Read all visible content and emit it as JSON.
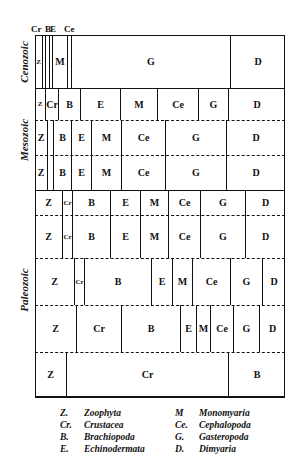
{
  "eras": [
    {
      "label": "Cenozoic",
      "center_y": 62
    },
    {
      "label": "Mesozoic",
      "center_y": 140
    },
    {
      "label": "Paleozoic",
      "center_y": 290
    }
  ],
  "top_labels": [
    {
      "text": "Cr",
      "x": 31
    },
    {
      "text": "B",
      "x": 45
    },
    {
      "text": "E",
      "x": 50
    },
    {
      "text": "Ce",
      "x": 64
    }
  ],
  "rows": [
    {
      "era": "Cenozoic",
      "top": 35,
      "height": 53,
      "bottom_line": "solid",
      "cells": [
        {
          "label": "Z",
          "x": 0,
          "w": 7
        },
        {
          "label": "",
          "x": 7,
          "w": 3
        },
        {
          "label": "",
          "x": 10,
          "w": 4
        },
        {
          "label": "",
          "x": 14,
          "w": 3
        },
        {
          "label": "M",
          "x": 17,
          "w": 15
        },
        {
          "label": "",
          "x": 32,
          "w": 4
        },
        {
          "label": "G",
          "x": 36,
          "w": 159
        },
        {
          "label": "D",
          "x": 195,
          "w": 55
        }
      ]
    },
    {
      "era": "Mesozoic",
      "top": 88,
      "height": 32,
      "bottom_line": "dashed",
      "cells": [
        {
          "label": "Z",
          "x": 0,
          "w": 10
        },
        {
          "label": "Cr",
          "x": 10,
          "w": 13
        },
        {
          "label": "B",
          "x": 23,
          "w": 22
        },
        {
          "label": "E",
          "x": 45,
          "w": 40
        },
        {
          "label": "M",
          "x": 85,
          "w": 37
        },
        {
          "label": "Ce",
          "x": 122,
          "w": 41
        },
        {
          "label": "G",
          "x": 163,
          "w": 30
        },
        {
          "label": "D",
          "x": 193,
          "w": 57
        }
      ]
    },
    {
      "era": "Mesozoic",
      "top": 120,
      "height": 35,
      "bottom_line": "dashed",
      "cells": [
        {
          "label": "Z",
          "x": 0,
          "w": 12
        },
        {
          "label": "",
          "x": 12,
          "w": 6
        },
        {
          "label": "B",
          "x": 18,
          "w": 18
        },
        {
          "label": "E",
          "x": 36,
          "w": 20
        },
        {
          "label": "M",
          "x": 56,
          "w": 30
        },
        {
          "label": "Ce",
          "x": 86,
          "w": 44
        },
        {
          "label": "G",
          "x": 130,
          "w": 61
        },
        {
          "label": "D",
          "x": 191,
          "w": 59
        }
      ]
    },
    {
      "era": "Mesozoic",
      "top": 155,
      "height": 35,
      "bottom_line": "solid",
      "cells": [
        {
          "label": "Z",
          "x": 0,
          "w": 12
        },
        {
          "label": "",
          "x": 12,
          "w": 6
        },
        {
          "label": "B",
          "x": 18,
          "w": 18
        },
        {
          "label": "E",
          "x": 36,
          "w": 20
        },
        {
          "label": "M",
          "x": 56,
          "w": 30
        },
        {
          "label": "Ce",
          "x": 86,
          "w": 44
        },
        {
          "label": "G",
          "x": 130,
          "w": 61
        },
        {
          "label": "D",
          "x": 191,
          "w": 59
        }
      ]
    },
    {
      "era": "Paleozoic",
      "top": 190,
      "height": 25,
      "bottom_line": "dashed",
      "cells": [
        {
          "label": "Z",
          "x": 0,
          "w": 27
        },
        {
          "label": "Cr",
          "x": 27,
          "w": 10
        },
        {
          "label": "B",
          "x": 37,
          "w": 38
        },
        {
          "label": "E",
          "x": 75,
          "w": 30
        },
        {
          "label": "M",
          "x": 105,
          "w": 28
        },
        {
          "label": "Ce",
          "x": 133,
          "w": 32
        },
        {
          "label": "G",
          "x": 165,
          "w": 45
        },
        {
          "label": "D",
          "x": 210,
          "w": 40
        }
      ]
    },
    {
      "era": "Paleozoic",
      "top": 215,
      "height": 43,
      "bottom_line": "dashed",
      "cells": [
        {
          "label": "Z",
          "x": 0,
          "w": 27
        },
        {
          "label": "Cr",
          "x": 27,
          "w": 10
        },
        {
          "label": "B",
          "x": 37,
          "w": 38
        },
        {
          "label": "E",
          "x": 75,
          "w": 30
        },
        {
          "label": "M",
          "x": 105,
          "w": 28
        },
        {
          "label": "Ce",
          "x": 133,
          "w": 32
        },
        {
          "label": "G",
          "x": 165,
          "w": 45
        },
        {
          "label": "D",
          "x": 210,
          "w": 40
        }
      ]
    },
    {
      "era": "Paleozoic",
      "top": 258,
      "height": 47,
      "bottom_line": "dashed",
      "cells": [
        {
          "label": "Z",
          "x": 0,
          "w": 39
        },
        {
          "label": "Cr",
          "x": 39,
          "w": 10
        },
        {
          "label": "B",
          "x": 49,
          "w": 67
        },
        {
          "label": "E",
          "x": 116,
          "w": 21
        },
        {
          "label": "M",
          "x": 137,
          "w": 20
        },
        {
          "label": "Ce",
          "x": 157,
          "w": 38
        },
        {
          "label": "G",
          "x": 195,
          "w": 32
        },
        {
          "label": "D",
          "x": 227,
          "w": 23
        }
      ]
    },
    {
      "era": "Paleozoic",
      "top": 305,
      "height": 47,
      "bottom_line": "dashed",
      "cells": [
        {
          "label": "Z",
          "x": 0,
          "w": 41
        },
        {
          "label": "Cr",
          "x": 41,
          "w": 45
        },
        {
          "label": "B",
          "x": 86,
          "w": 59
        },
        {
          "label": "E",
          "x": 145,
          "w": 16
        },
        {
          "label": "M",
          "x": 161,
          "w": 14
        },
        {
          "label": "Ce",
          "x": 175,
          "w": 23
        },
        {
          "label": "G",
          "x": 198,
          "w": 26
        },
        {
          "label": "D",
          "x": 224,
          "w": 26
        }
      ]
    },
    {
      "era": "Paleozoic",
      "top": 352,
      "height": 45,
      "bottom_line": "solid",
      "cells": [
        {
          "label": "Z",
          "x": 0,
          "w": 31
        },
        {
          "label": "Cr",
          "x": 31,
          "w": 162
        },
        {
          "label": "B",
          "x": 193,
          "w": 57
        }
      ]
    }
  ],
  "legend": {
    "left": [
      {
        "abbr": "Z.",
        "name": "Zoophyta"
      },
      {
        "abbr": "Cr.",
        "name": "Crustacea"
      },
      {
        "abbr": "B.",
        "name": "Brachiopoda"
      },
      {
        "abbr": "E.",
        "name": "Echinodermata"
      }
    ],
    "right": [
      {
        "abbr": "M",
        "name": "Monomyaria"
      },
      {
        "abbr": "Ce.",
        "name": "Cephalopoda"
      },
      {
        "abbr": "G.",
        "name": "Gasteropoda"
      },
      {
        "abbr": "D.",
        "name": "Dimyaria"
      }
    ]
  }
}
